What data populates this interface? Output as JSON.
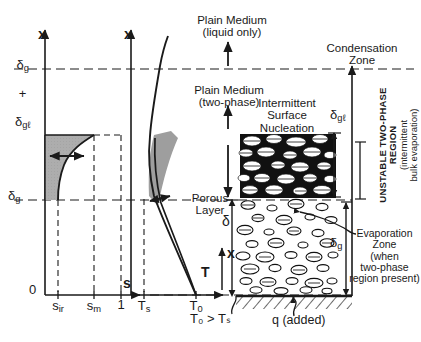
{
  "figure": {
    "type": "schematic-diagram"
  },
  "labels": {
    "plain_medium_liquid": "Plain Medium\n(liquid only)",
    "plain_medium_twophase": "Plain Medium\n(two-phase)",
    "condensation_zone": "Condensation\nZone",
    "intermittent_surface_nucleation": "Intermittent\nSurface\nNucleation",
    "porous_layer": "Porous\nLayer",
    "unstable_region": "UNSTABLE TWO-PHASE\nREGION",
    "unstable_region_paren": "(intermittent\nbulk evaporation)",
    "evaporation_zone": "Evaporation\nZone\n(when\ntwo-phase\nregion present)",
    "heat_flux": "q (added)",
    "temp_inequality": "T₀ > Tₛ"
  },
  "symbols": {
    "x_axis_left": "x",
    "x_axis_mid": "x",
    "x_inner": "x",
    "delta": "δ",
    "delta_g": "δ",
    "delta_g_sub": "g",
    "delta_gl": "δ",
    "delta_gl_sub": "gℓ",
    "plus": "+",
    "zero": "0"
  },
  "chart_data": [
    {
      "type": "line",
      "name": "saturation-profile",
      "title": "",
      "xlabel": "s",
      "ylabel": "x",
      "x_ticks": [
        "sᵢᵣ",
        "sₘ",
        "1"
      ],
      "x_tick_values": [
        0.18,
        0.62,
        0.82
      ],
      "y_ticks": [
        "0",
        "δg",
        "δg+δgℓ"
      ],
      "y_tick_values": [
        0,
        0.46,
        0.86
      ],
      "axis_origin_label": "0",
      "grid": false,
      "series": [
        {
          "name": "saturation s(x)",
          "comment": "concave curve from s_ir at x=delta_g rising to s_m at x=delta_g+delta_gl",
          "points": [
            [
              0.18,
              0.46
            ],
            [
              0.19,
              0.55
            ],
            [
              0.24,
              0.65
            ],
            [
              0.34,
              0.74
            ],
            [
              0.47,
              0.81
            ],
            [
              0.62,
              0.86
            ]
          ]
        }
      ],
      "shaded_region": "between s=s_ir vertical and the saturation curve, from x=delta_g to x=delta_g+delta_gl",
      "annotation_arrow": "horizontal double arrow inside shaded region"
    },
    {
      "type": "line",
      "name": "temperature-profile",
      "title": "",
      "xlabel": "T",
      "ylabel": "x",
      "x_ticks": [
        "Tₛ",
        "T₀"
      ],
      "x_tick_values": [
        0.26,
        0.72
      ],
      "y_ticks": [
        "0",
        "δg",
        "δg+δgℓ"
      ],
      "y_tick_values": [
        0,
        0.46,
        0.86
      ],
      "grid": false,
      "series": [
        {
          "name": "temperature T(x) upper branch",
          "points": [
            [
              0.72,
              0.0
            ],
            [
              0.3,
              0.46
            ],
            [
              0.255,
              0.86
            ],
            [
              0.28,
              1.0
            ]
          ]
        },
        {
          "name": "temperature T(x) lower branch",
          "points": [
            [
              0.72,
              0.0
            ],
            [
              0.36,
              0.44
            ],
            [
              0.26,
              0.86
            ]
          ]
        }
      ],
      "shaded_region": "thin wedge between the two temperature branches",
      "annotation_arrow": "short horizontal double arrow near x=delta_g"
    }
  ],
  "dimension_lines": [
    {
      "name": "plain-medium-liquid-extent",
      "symbol": ""
    },
    {
      "name": "plain-medium-twophase-extent",
      "symbol": ""
    },
    {
      "name": "porous-layer-thickness",
      "symbol": "δ"
    },
    {
      "name": "gas-liquid-thickness",
      "symbol": "δgℓ"
    },
    {
      "name": "gas-thickness",
      "symbol": "δg"
    },
    {
      "name": "inner-height-coordinate",
      "symbol": "x"
    }
  ]
}
